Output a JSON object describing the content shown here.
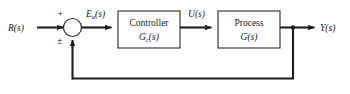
{
  "diagram": {
    "type": "control-system-block-diagram",
    "background_color": "#ffffff",
    "line_color": "#1c1c1c",
    "text_color": "#1a1a1a"
  },
  "signals": {
    "input": {
      "label": "R(s)",
      "base": "R",
      "subscript": "",
      "arg": "(s)"
    },
    "error": {
      "label": "Ea(s)",
      "base": "E",
      "subscript": "a",
      "arg": "(s)"
    },
    "control": {
      "label": "U(s)",
      "base": "U",
      "subscript": "",
      "arg": "(s)"
    },
    "output": {
      "label": "Y(s)",
      "base": "Y",
      "subscript": "",
      "arg": "(s)"
    }
  },
  "summing_junction": {
    "name": "summing-junction",
    "positive_sign": "+",
    "feedback_sign": "±"
  },
  "blocks": [
    {
      "id": "controller",
      "title": "Controller",
      "transfer_base": "G",
      "transfer_subscript": "c",
      "transfer_arg": "(s)"
    },
    {
      "id": "process",
      "title": "Process",
      "transfer_base": "G",
      "transfer_subscript": "",
      "transfer_arg": "(s)"
    }
  ],
  "feedback": {
    "name": "feedback-path",
    "description": "unity feedback from output takeoff to summing junction"
  }
}
